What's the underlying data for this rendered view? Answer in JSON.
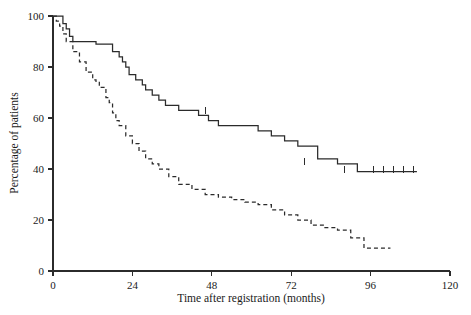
{
  "chart_data": {
    "type": "line",
    "title": "",
    "subtitle": "",
    "xlabel": "Time after registration (months)",
    "ylabel": "Percentage of patients",
    "xlim": [
      0,
      120
    ],
    "ylim": [
      0,
      100
    ],
    "xticks": [
      0,
      24,
      48,
      72,
      96,
      120
    ],
    "yticks": [
      0,
      20,
      40,
      60,
      80,
      100
    ],
    "xtick_labels": [
      "0",
      "24",
      "48",
      "72",
      "96",
      "120"
    ],
    "ytick_labels": [
      "0",
      "20",
      "40",
      "60",
      "80",
      "100"
    ],
    "grid": false,
    "legend_position": "none",
    "series": [
      {
        "name": "solid-curve",
        "style": "solid",
        "step": "post",
        "x": [
          0,
          2,
          3,
          4,
          5,
          6,
          9,
          10,
          11,
          13,
          16,
          18,
          20,
          21,
          22,
          23,
          25,
          27,
          28,
          30,
          32,
          34,
          36,
          38,
          41,
          44,
          47,
          50,
          54,
          58,
          62,
          66,
          70,
          74,
          80,
          86,
          92,
          110
        ],
        "y": [
          100,
          100,
          97,
          95,
          92,
          90,
          90,
          90,
          90,
          89,
          89,
          86,
          84,
          82,
          80,
          77,
          75,
          73,
          71,
          69,
          67,
          65,
          65,
          63,
          63,
          61,
          59,
          57,
          57,
          57,
          55,
          53,
          51,
          49,
          44,
          42,
          39,
          39
        ],
        "censor_x": [
          46,
          76,
          88,
          97,
          100,
          103,
          106,
          109
        ],
        "censor_y": [
          62,
          42,
          39,
          39,
          39,
          39,
          39,
          39
        ]
      },
      {
        "name": "dashed-curve",
        "style": "dashed",
        "step": "post",
        "x": [
          0,
          1,
          2,
          3,
          4,
          6,
          8,
          10,
          12,
          13,
          14,
          16,
          17,
          18,
          19,
          20,
          22,
          24,
          26,
          28,
          30,
          32,
          35,
          38,
          42,
          46,
          50,
          54,
          58,
          62,
          66,
          70,
          74,
          78,
          82,
          86,
          90,
          94,
          102
        ],
        "y": [
          100,
          98,
          96,
          93,
          90,
          86,
          82,
          78,
          75,
          74,
          72,
          68,
          66,
          62,
          59,
          57,
          53,
          50,
          47,
          44,
          42,
          40,
          37,
          34,
          32,
          30,
          29,
          28,
          27,
          26,
          24,
          22,
          20,
          18,
          17,
          16,
          13,
          9,
          9
        ],
        "censor_x": [],
        "censor_y": []
      }
    ]
  },
  "axis": {
    "x_title": "Time after registration (months)",
    "y_title": "Percentage of patients"
  }
}
